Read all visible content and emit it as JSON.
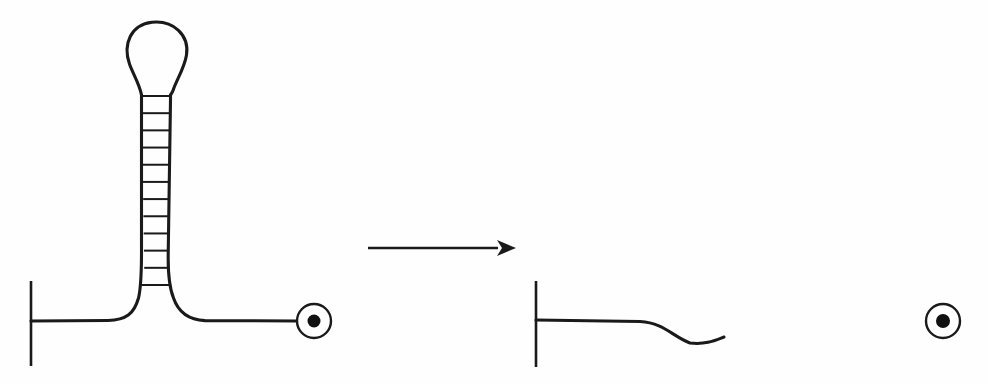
{
  "figure": {
    "kind": "line-diagram",
    "title": "RNA hairpin (stem-loop) unfolding into a single strand",
    "background_color": "#fefefe",
    "ink_color": "#1a1a1a",
    "width": 988,
    "height": 384
  },
  "panels": [
    {
      "id": "folded",
      "name": "folded-hairpin-panel",
      "description": "Folded hairpin: horizontal backbone anchored at a vertical tick on the left, rising into a base-paired stem with a ladder of rungs topped by a teardrop loop, continuing right to a ringed bead terminus.",
      "anchor_tick": {
        "x": 31,
        "y_top": 281,
        "y_bottom": 366
      },
      "backbone_y": 321,
      "backbone_start_x": 31,
      "backbone_end_x": 297,
      "stem": {
        "axis_x": 156,
        "top_y": 92,
        "bottom_y": 291,
        "top_half_width": 14.5,
        "bottom_half_width": 11.5,
        "rung_count": 12
      },
      "loop": {
        "center_x": 154,
        "apex_y": 22,
        "widest_y": 50,
        "left_x": 126,
        "right_x": 183,
        "neck_y": 92
      },
      "terminus": {
        "name": "bead-terminus",
        "cx": 314,
        "cy": 321,
        "ring_r": 17,
        "dot_r": 6.5
      }
    },
    {
      "id": "unfolded",
      "name": "unfolded-strand-panel",
      "description": "Unfolded single strand: same vertical tick anchor on the left, a gently undulating backbone with two troughs and two crests, ending in a ringed bead terminus.",
      "anchor_tick": {
        "x": 536,
        "y_top": 281,
        "y_bottom": 367
      },
      "backbone_y": 320,
      "backbone_start_x": 536,
      "backbone_end_x": 926,
      "wave": {
        "flat_until_x": 640,
        "trough_1": {
          "x": 698,
          "y": 343
        },
        "crest_1": {
          "x": 767,
          "y": 314
        },
        "trough_2": {
          "x": 812,
          "y": 333
        },
        "crest_2": {
          "x": 883,
          "y": 316
        }
      },
      "terminus": {
        "name": "bead-terminus",
        "cx": 943,
        "cy": 321,
        "ring_r": 17,
        "dot_r": 7
      }
    }
  ],
  "transition_arrow": {
    "name": "transition-arrow",
    "direction": "left-to-right",
    "shaft_start_x": 368,
    "shaft_end_x": 498,
    "y": 248,
    "head_tip_x": 516,
    "head_half_height": 8
  },
  "a11y": {
    "figure_label": "Hairpin stem-loop unfolding into an extended single strand",
    "folded_label": "Folded hairpin with base-paired stem and terminal loop",
    "unfolded_label": "Unfolded, undulating single strand",
    "arrow_label": "Unfolding transition arrow"
  }
}
